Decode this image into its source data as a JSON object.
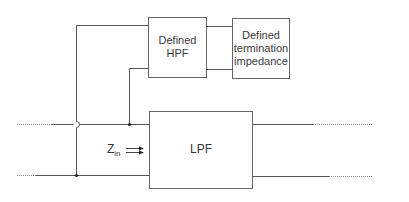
{
  "diagram": {
    "colors": {
      "line": "#555555",
      "box": "#666666",
      "text": "#3a3a3a",
      "background": "#ffffff"
    },
    "blocks": {
      "hpf": {
        "line1": "Defined",
        "line2": "HPF"
      },
      "termination": {
        "line1": "Defined",
        "line2": "termination",
        "line3": "impedance"
      },
      "lpf": {
        "label": "LPF"
      }
    },
    "input_impedance": {
      "symbol": "Z",
      "subscript": "in"
    }
  }
}
